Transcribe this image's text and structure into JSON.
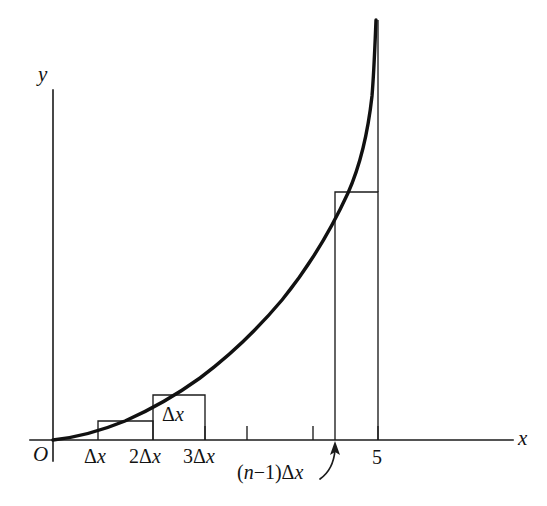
{
  "figure": {
    "background_color": "#ffffff",
    "ink_color": "#131313",
    "axes": {
      "y_axis_label": "y",
      "x_axis_label": "x",
      "origin_label": "O"
    },
    "tick_labels": {
      "delta_x": "Δx",
      "two_delta_x": "2Δx",
      "three_delta_x": "3Δx",
      "n_minus_one_delta_x": "(n−1)Δx",
      "upper_limit": "5"
    },
    "annotations": {
      "rectangle_width_label": "Δx"
    }
  },
  "chart_data": {
    "type": "area",
    "title": "",
    "subtitle": "",
    "xlabel": "x",
    "ylabel": "y",
    "grid": false,
    "legend": null,
    "xlim": [
      0,
      5.9
    ],
    "ylim": [
      0,
      5.9
    ],
    "curve": {
      "name": "f(x)",
      "description": "increasing convex curve through the origin",
      "x": [
        0.0,
        0.25,
        0.5,
        0.75,
        1.0,
        1.25,
        1.5,
        1.75,
        2.0,
        2.25,
        2.5,
        2.75,
        3.0,
        3.25,
        3.5,
        3.75,
        4.0,
        4.25,
        4.5,
        4.75,
        5.0
      ],
      "y": [
        0.0,
        0.03,
        0.12,
        0.27,
        0.46,
        0.69,
        0.95,
        1.23,
        1.54,
        1.87,
        2.22,
        2.59,
        2.98,
        3.39,
        3.81,
        4.25,
        4.7,
        5.03,
        5.26,
        5.42,
        5.51
      ]
    },
    "x_axis_ticks": [
      {
        "value": 0.0,
        "label": "O",
        "tick_drawn": false
      },
      {
        "value": 0.55,
        "label": "Δx",
        "tick_drawn": false
      },
      {
        "value": 1.15,
        "label": "2Δx",
        "tick_drawn": false
      },
      {
        "value": 1.75,
        "label": "3Δx",
        "tick_drawn": true
      },
      {
        "value": 2.25,
        "label": "",
        "tick_drawn": true
      },
      {
        "value": 3.0,
        "label": "",
        "tick_drawn": true
      },
      {
        "value": 3.27,
        "label": "(n−1)Δx",
        "tick_drawn": false
      },
      {
        "value": 3.75,
        "label": "5",
        "tick_drawn": true
      }
    ],
    "rectangles": [
      {
        "index": 1,
        "x_left": 0.55,
        "x_right": 1.15,
        "height": 0.24,
        "label": ""
      },
      {
        "index": 2,
        "x_left": 1.15,
        "x_right": 1.75,
        "height": 0.55,
        "label": "Δx"
      },
      {
        "index": 3,
        "x_left": 3.27,
        "x_right": 3.75,
        "height": 3.02,
        "label": ""
      }
    ]
  }
}
